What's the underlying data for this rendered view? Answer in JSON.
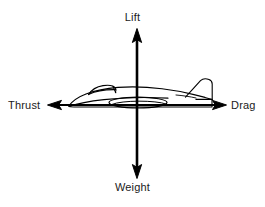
{
  "diagram": {
    "background_color": "#ffffff",
    "stroke_color": "#000000",
    "text_color": "#1a1a1a",
    "labels": {
      "lift": "Lift",
      "weight": "Weight",
      "thrust": "Thrust",
      "drag": "Drag"
    },
    "arrows": [
      {
        "name": "lift-arrow",
        "direction": "up",
        "label": "Lift",
        "from_x": 137,
        "from_y": 105,
        "to_x": 137,
        "to_y": 30
      },
      {
        "name": "weight-arrow",
        "direction": "down",
        "label": "Weight",
        "from_x": 137,
        "from_y": 105,
        "to_x": 137,
        "to_y": 178
      },
      {
        "name": "thrust-arrow",
        "direction": "left",
        "label": "Thrust",
        "from_x": 137,
        "from_y": 105,
        "to_x": 48,
        "to_y": 105
      },
      {
        "name": "drag-arrow",
        "direction": "right",
        "label": "Drag",
        "from_x": 137,
        "from_y": 105,
        "to_x": 226,
        "to_y": 105
      }
    ],
    "aircraft": {
      "name": "airplane-silhouette",
      "view": "side-profile",
      "nose_x": 68,
      "tail_x": 212,
      "baseline_y": 105,
      "parts": [
        "fuselage",
        "canopy",
        "wing",
        "vertical-stabilizer"
      ]
    }
  }
}
